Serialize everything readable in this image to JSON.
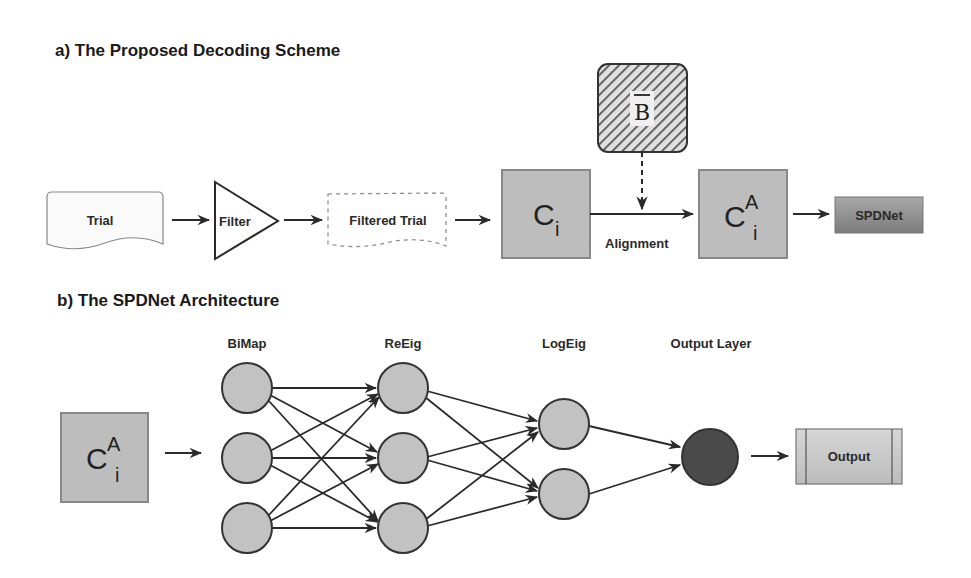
{
  "section_a": {
    "title": "a) The Proposed Decoding Scheme",
    "nodes": {
      "trial": "Trial",
      "filter": "Filter",
      "filtered_trial": "Filtered Trial",
      "covariance": {
        "base": "C",
        "sub": "i"
      },
      "reference": {
        "base": "B",
        "decoration": "overbar"
      },
      "aligned_covariance": {
        "base": "C",
        "sup": "A",
        "sub": "i"
      },
      "spdnet": "SPDNet"
    },
    "edge_labels": {
      "alignment": "Alignment"
    }
  },
  "section_b": {
    "title": "b) The SPDNet Architecture",
    "input": {
      "base": "C",
      "sup": "A",
      "sub": "i"
    },
    "layers": [
      {
        "label": "BiMap",
        "nodes": 3
      },
      {
        "label": "ReEig",
        "nodes": 3
      },
      {
        "label": "LogEig",
        "nodes": 2
      },
      {
        "label": "Output Layer",
        "nodes": 1
      }
    ],
    "output": "Output"
  },
  "colors": {
    "box_fill": "#bdbdbd",
    "node_fill": "#c2c2c2",
    "output_node_fill": "#4a4a4a",
    "stroke": "#333333",
    "spdnet_fill": "#8f8f8f"
  }
}
